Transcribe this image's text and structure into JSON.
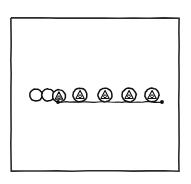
{
  "figure": {
    "title": "Row of circles connected by a baseline",
    "medium": "hand-drawn ink sketch",
    "canvas": {
      "width": 191,
      "height": 184,
      "background": "#ffffff"
    },
    "frame": {
      "name": "border-rectangle",
      "x": 11,
      "y": 18,
      "width": 168,
      "height": 153,
      "stroke": "#2b2b2b",
      "fill": "#ffffff"
    },
    "baseline": {
      "name": "horizontal-connector-line",
      "x_start": 58,
      "x_end": 162,
      "y": 102,
      "stroke": "#1a1a1a",
      "endpoint_marker": "filled-dot"
    },
    "endpoints": [
      {
        "label": "left-endpoint",
        "cx": 58,
        "cy": 102,
        "r": 1.9
      },
      {
        "label": "right-endpoint",
        "cx": 162,
        "cy": 102,
        "r": 1.9
      }
    ],
    "nodes": [
      {
        "label": "circle-1",
        "cx": 36,
        "cy": 95,
        "r": 6.2,
        "glyph": "none"
      },
      {
        "label": "circle-2",
        "cx": 48,
        "cy": 95,
        "r": 6.2,
        "glyph": "none"
      },
      {
        "label": "circle-3",
        "cx": 59,
        "cy": 96,
        "r": 6.4,
        "glyph": "triangle-dot"
      },
      {
        "label": "circle-4",
        "cx": 80,
        "cy": 95,
        "r": 7.0,
        "glyph": "triangle-dot"
      },
      {
        "label": "circle-5",
        "cx": 105,
        "cy": 95,
        "r": 7.0,
        "glyph": "triangle-dot"
      },
      {
        "label": "circle-6",
        "cx": 129,
        "cy": 95,
        "r": 7.0,
        "glyph": "triangle-dot"
      },
      {
        "label": "circle-7",
        "cx": 152,
        "cy": 95,
        "r": 7.0,
        "glyph": "triangle-dot"
      }
    ],
    "glyph_legend": {
      "triangle-dot": "rounded triangle outline with a small circle at its base",
      "none": "empty circle outline"
    },
    "counts": {
      "total_circles": 7,
      "empty_circles": 2,
      "glyph_circles": 5
    }
  }
}
